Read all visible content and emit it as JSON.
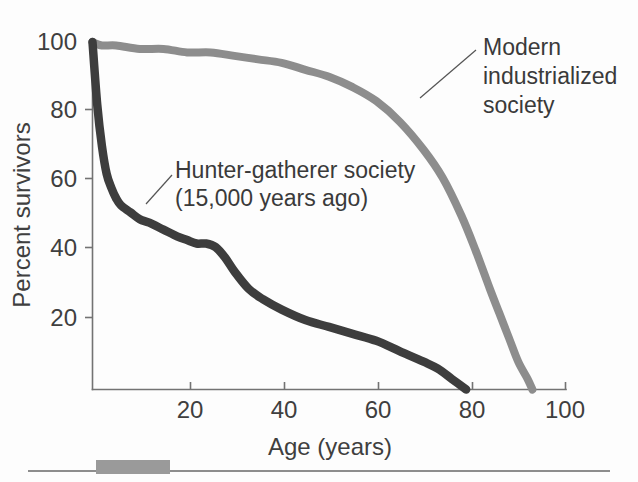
{
  "chart_data": {
    "type": "line",
    "title": "",
    "xlabel": "Age (years)",
    "ylabel": "Percent survivors",
    "xlim": [
      0,
      100
    ],
    "ylim": [
      0,
      100
    ],
    "xticks": [
      20,
      40,
      60,
      80,
      100
    ],
    "yticks": [
      20,
      40,
      60,
      80,
      100
    ],
    "grid": false,
    "legend_position": "inline-annotations",
    "series": [
      {
        "name": "Hunter-gatherer society (15,000 years ago)",
        "color": "#3d3d3d",
        "x": [
          0,
          1,
          2,
          3,
          4,
          5,
          6,
          8,
          10,
          12,
          15,
          18,
          20,
          22,
          24,
          26,
          28,
          30,
          33,
          36,
          40,
          45,
          50,
          55,
          60,
          65,
          70,
          73,
          76,
          79
        ],
        "y": [
          100,
          82,
          70,
          62,
          58,
          55,
          53,
          51,
          49,
          48,
          46,
          44,
          43,
          42,
          42,
          41,
          38,
          34,
          29,
          26,
          23,
          20,
          18,
          16,
          14,
          11,
          8,
          6,
          3,
          0
        ]
      },
      {
        "name": "Modern industrialized society",
        "color": "#8d8d8d",
        "x": [
          0,
          2,
          5,
          10,
          15,
          20,
          25,
          30,
          35,
          40,
          45,
          50,
          55,
          60,
          65,
          70,
          74,
          78,
          81,
          84,
          86,
          88,
          90,
          92,
          93
        ],
        "y": [
          100,
          99,
          99,
          98,
          98,
          97,
          97,
          96,
          95,
          94,
          92,
          90,
          87,
          83,
          77,
          69,
          61,
          50,
          40,
          29,
          22,
          15,
          8,
          3,
          0
        ]
      }
    ],
    "annotations": [
      {
        "id": "hunter-gatherer",
        "lines": [
          "Hunter-gatherer society",
          "(15,000 years ago)"
        ],
        "text_x": 175,
        "text_y": 178,
        "leader_from_x": 172,
        "leader_from_y": 175,
        "leader_to_x": 146,
        "leader_to_y": 204
      },
      {
        "id": "modern-industrialized",
        "lines": [
          "Modern",
          "industrialized",
          "society"
        ],
        "text_x": 483,
        "text_y": 55,
        "leader_from_x": 476,
        "leader_from_y": 50,
        "leader_to_x": 420,
        "leader_to_y": 98
      }
    ]
  },
  "axes": {
    "y_title": "Percent survivors",
    "x_title": "Age (years)",
    "y_tick_labels": [
      "100",
      "80",
      "60",
      "40",
      "20"
    ],
    "x_tick_labels": [
      "20",
      "40",
      "60",
      "80",
      "100"
    ]
  },
  "footer": {
    "rule_visible": true,
    "block_visible": true
  }
}
